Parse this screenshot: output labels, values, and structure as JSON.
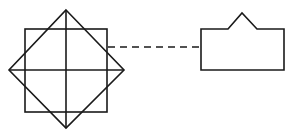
{
  "diagram": {
    "stroke_color": "#1a1a1a",
    "background": "#ffffff",
    "shapes": [
      {
        "name": "square",
        "type": "rect",
        "x": 25,
        "y": 29,
        "width": 82,
        "height": 83
      },
      {
        "name": "diamond",
        "type": "polygon",
        "points": [
          [
            66,
            10
          ],
          [
            124,
            70
          ],
          [
            66,
            128
          ],
          [
            9,
            70
          ]
        ]
      },
      {
        "name": "vertical-axis",
        "type": "line",
        "x1": 66,
        "y1": 10,
        "x2": 66,
        "y2": 128
      },
      {
        "name": "horizontal-axis",
        "type": "line",
        "x1": 9,
        "y1": 70,
        "x2": 124,
        "y2": 70
      },
      {
        "name": "dashed-connector",
        "type": "line",
        "style": "dashed",
        "x1": 108,
        "y1": 47,
        "x2": 201,
        "y2": 47
      },
      {
        "name": "house-shape",
        "type": "polygon",
        "points": [
          [
            201,
            29
          ],
          [
            228,
            29
          ],
          [
            242,
            13
          ],
          [
            257,
            29
          ],
          [
            284,
            29
          ],
          [
            284,
            70
          ],
          [
            201,
            70
          ]
        ]
      }
    ]
  }
}
